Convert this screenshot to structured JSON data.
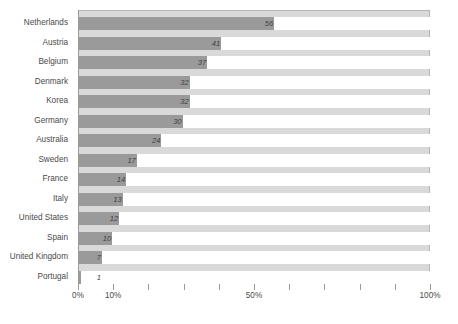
{
  "chart_data": {
    "type": "bar",
    "orientation": "horizontal",
    "title": "",
    "subtitle": "",
    "xlabel": "",
    "ylabel": "",
    "xlim": [
      0,
      100
    ],
    "grid": false,
    "legend": null,
    "categories": [
      "Netherlands",
      "Austria",
      "Belgium",
      "Denmark",
      "Korea",
      "Germany",
      "Australia",
      "Sweden",
      "France",
      "Italy",
      "United States",
      "Spain",
      "United Kingdom",
      "Portugal"
    ],
    "values": [
      56,
      41,
      37,
      32,
      32,
      30,
      24,
      17,
      14,
      13,
      12,
      10,
      7,
      1
    ],
    "value_labels": [
      "56",
      "41",
      "37",
      "32",
      "32",
      "30",
      "24",
      "17",
      "14",
      "13",
      "12",
      "10",
      "7",
      "1"
    ],
    "xticks": [
      0,
      10,
      20,
      30,
      40,
      50,
      60,
      70,
      80,
      90,
      100
    ],
    "xticklabels": [
      "0%",
      "10%",
      "",
      "",
      "",
      "50%",
      "",
      "",
      "",
      "",
      "100%"
    ],
    "colors": {
      "bar": "#9a9a9a",
      "plot_background": "#d9d9d9",
      "page_background": "#ffffff",
      "axis": "#9a9a9a",
      "label_text": "#4a4a4a",
      "value_text": "#3f3f3f"
    }
  }
}
